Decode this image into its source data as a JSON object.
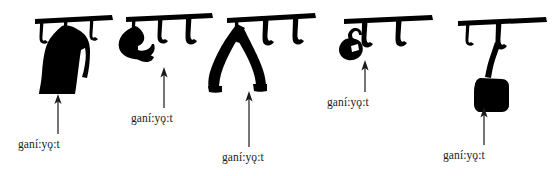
{
  "figure": {
    "name": "hanging-objects-illustration",
    "background_color": "#ffffff",
    "ink_color": "#000000",
    "text_color": "#1a1a1a",
    "width": 552,
    "height": 176
  },
  "panels": [
    {
      "id": "panel-1",
      "object_depicted": "long-coat",
      "hook_count": 3,
      "hanging_on_hook_index": 1,
      "gloss": "ganí:yǫ:t",
      "gloss_x": 18,
      "gloss_y": 139,
      "arrow": {
        "x": 58,
        "y_top": 95,
        "y_bottom": 134
      }
    },
    {
      "id": "panel-2",
      "object_depicted": "cap",
      "hook_count": 3,
      "hanging_on_hook_index": 0,
      "gloss": "ganí:yǫ:t",
      "gloss_x": 131,
      "gloss_y": 113,
      "arrow": {
        "x": 164,
        "y_top": 68,
        "y_bottom": 108
      }
    },
    {
      "id": "panel-3",
      "object_depicted": "draped-jacket",
      "hook_count": 3,
      "hanging_on_hook_index": 0,
      "gloss": "ganí:yǫ:t",
      "gloss_x": 222,
      "gloss_y": 152,
      "arrow": {
        "x": 249,
        "y_top": 92,
        "y_bottom": 147
      }
    },
    {
      "id": "panel-4",
      "object_depicted": "small-pouch",
      "hook_count": 2,
      "hanging_on_hook_index": 0,
      "gloss": "ganí:yǫ:t",
      "gloss_x": 327,
      "gloss_y": 97,
      "arrow": {
        "x": 365,
        "y_top": 60,
        "y_bottom": 92
      }
    },
    {
      "id": "panel-5",
      "object_depicted": "shoulder-bag",
      "hook_count": 2,
      "hanging_on_hook_index": 1,
      "gloss": "ganí:yǫ:t",
      "gloss_x": 443,
      "gloss_y": 150,
      "arrow": {
        "x": 484,
        "y_top": 108,
        "y_bottom": 145
      }
    }
  ]
}
